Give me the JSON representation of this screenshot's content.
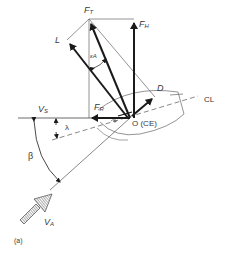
{
  "diagram": {
    "labels": {
      "ft": {
        "main": "F",
        "sub": "T"
      },
      "fh": {
        "main": "F",
        "sub": "H"
      },
      "l": {
        "main": "L"
      },
      "ea": {
        "main": "ε",
        "sub": "A"
      },
      "d": {
        "main": "D"
      },
      "fr": {
        "main": "F",
        "sub": "R"
      },
      "vs": {
        "main": "V",
        "sub": "S"
      },
      "lambda": {
        "main": "λ"
      },
      "o": {
        "main": "O (CE)"
      },
      "cl": {
        "main": "CL"
      },
      "beta": {
        "main": "β"
      },
      "va": {
        "main": "V",
        "sub": "A"
      },
      "caption": {
        "main": "(a)"
      }
    },
    "colors": {
      "stroke": "#1a1a1a",
      "thin": "#555555",
      "text": "#3a3a3a"
    }
  }
}
